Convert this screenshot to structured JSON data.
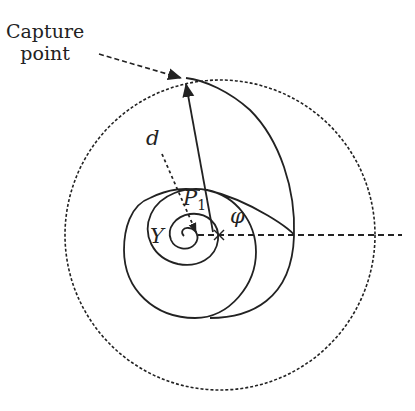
{
  "diagram": {
    "type": "spiral-capture-geometry",
    "labels": {
      "capture_point_line1": "Capture",
      "capture_point_line2": "point",
      "distance": "d",
      "pursuer": "P",
      "pursuer_subscript": "1",
      "target": "Y",
      "angle": "φ"
    },
    "elements": [
      "outer dashed capture circle",
      "logarithmic spiral trajectory from Y to capture point",
      "solid arrow from pursuer P1 to capture point",
      "dotted arrow d toward Y",
      "dashed horizontal reference ray at angle φ",
      "dashed leader arrow from 'Capture point' label"
    ],
    "colors": {
      "stroke": "#222222",
      "background": "#ffffff"
    }
  }
}
